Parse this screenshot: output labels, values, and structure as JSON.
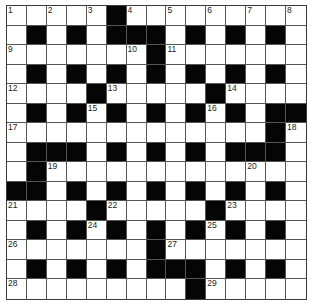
{
  "puzzle": {
    "rows": 15,
    "cols": 15,
    "block_color": "#050505",
    "cell_color": "#ffffff",
    "grid": [
      ".....#.........",
      ".#.#.###.#.#.#.",
      ".......#.......",
      ".#.#.#.#.#.#.#.",
      "....#.....#....",
      ".#.#.#.#.#.#.##",
      ".............#.",
      ".###.#.#.#.###.",
      ".#.............",
      "##.#.#.#.#.#.#.",
      "....#.....#....",
      ".#.#.#.#.#.#.#.",
      ".......#.......",
      ".#.#.#.###.#.#.",
      ".........#....."
    ],
    "numbers": [
      {
        "n": "1",
        "r": 0,
        "c": 0
      },
      {
        "n": "2",
        "r": 0,
        "c": 2
      },
      {
        "n": "3",
        "r": 0,
        "c": 4
      },
      {
        "n": "4",
        "r": 0,
        "c": 6
      },
      {
        "n": "5",
        "r": 0,
        "c": 8
      },
      {
        "n": "6",
        "r": 0,
        "c": 10
      },
      {
        "n": "7",
        "r": 0,
        "c": 12
      },
      {
        "n": "8",
        "r": 0,
        "c": 14
      },
      {
        "n": "9",
        "r": 2,
        "c": 0
      },
      {
        "n": "10",
        "r": 2,
        "c": 6
      },
      {
        "n": "11",
        "r": 2,
        "c": 8
      },
      {
        "n": "12",
        "r": 4,
        "c": 0
      },
      {
        "n": "13",
        "r": 4,
        "c": 5
      },
      {
        "n": "14",
        "r": 4,
        "c": 11
      },
      {
        "n": "15",
        "r": 5,
        "c": 4
      },
      {
        "n": "16",
        "r": 5,
        "c": 10
      },
      {
        "n": "17",
        "r": 6,
        "c": 0
      },
      {
        "n": "18",
        "r": 6,
        "c": 14
      },
      {
        "n": "19",
        "r": 8,
        "c": 2
      },
      {
        "n": "20",
        "r": 8,
        "c": 12
      },
      {
        "n": "21",
        "r": 10,
        "c": 0
      },
      {
        "n": "22",
        "r": 10,
        "c": 5
      },
      {
        "n": "23",
        "r": 10,
        "c": 11
      },
      {
        "n": "24",
        "r": 11,
        "c": 4
      },
      {
        "n": "25",
        "r": 11,
        "c": 10
      },
      {
        "n": "26",
        "r": 12,
        "c": 0
      },
      {
        "n": "27",
        "r": 12,
        "c": 8
      },
      {
        "n": "28",
        "r": 14,
        "c": 0
      },
      {
        "n": "29",
        "r": 14,
        "c": 10
      }
    ]
  }
}
